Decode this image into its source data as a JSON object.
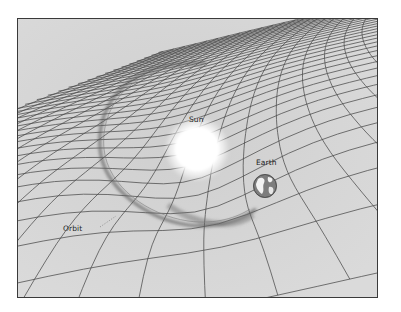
{
  "diagram": {
    "labels": {
      "sun": "Sun",
      "earth": "Earth",
      "orbit": "Orbit"
    },
    "colors": {
      "grid_surface": "#d6d6d6",
      "grid_line": "#4a4a4a",
      "frame_border": "#3a3a3a",
      "sun_glow": "#ffffff",
      "orbit_trail": "#6a6a6a",
      "earth_ocean": "#7a7a7a",
      "earth_land": "#f2f2f2",
      "label_text": "#1e1e1e"
    },
    "elements": [
      {
        "id": "sun",
        "shape": "glowing circle",
        "position": "center of gravity well"
      },
      {
        "id": "earth",
        "shape": "small globe",
        "position": "right of sun, on orbit"
      },
      {
        "id": "orbit",
        "shape": "elliptical trail",
        "position": "encircling sun"
      },
      {
        "id": "grid",
        "shape": "perspective mesh",
        "deformation": "funnel well beneath sun"
      }
    ]
  }
}
